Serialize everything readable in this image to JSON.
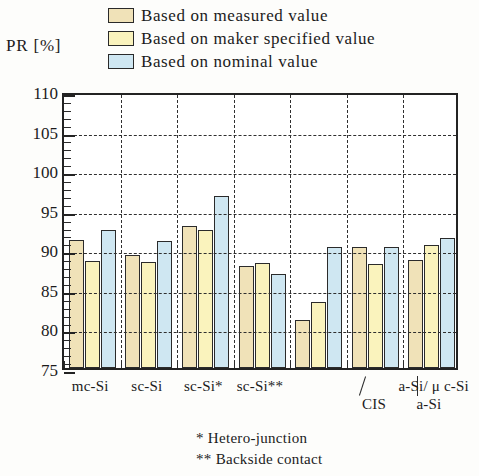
{
  "legend": {
    "items": [
      {
        "label": "Based on measured value",
        "color": "#f0e2b8"
      },
      {
        "label": "Based on maker specified value",
        "color": "#faf3bd"
      },
      {
        "label": "Based on nominal value",
        "color": "#cfe7f2"
      }
    ]
  },
  "axis": {
    "y_title": "PR [%]",
    "y_ticks": [
      "110",
      "105",
      "100",
      "95",
      "90",
      "85",
      "80",
      "75"
    ]
  },
  "footnotes": {
    "line1": "*  Hetero-junction",
    "line2": "** Backside  contact"
  },
  "x_row2": {
    "cis": "CIS",
    "asi": "a-Si"
  },
  "chart_data": {
    "type": "bar",
    "title": "",
    "xlabel": "",
    "ylabel": "PR [%]",
    "ylim": [
      75,
      110
    ],
    "ytick_step": 5,
    "grid": "horizontal-dashed + vertical-group-separators",
    "legend_position": "top",
    "categories": [
      "mc-Si",
      "sc-Si",
      "sc-Si*",
      "sc-Si**",
      "CIS",
      "a-Si",
      "a-Si/ μ c-Si"
    ],
    "series": [
      {
        "name": "Based on measured value",
        "color": "#f0e2b8",
        "values": [
          91.2,
          89.3,
          93.0,
          87.9,
          81.1,
          90.3,
          88.7
        ]
      },
      {
        "name": "Based on maker specified value",
        "color": "#faf3bd",
        "values": [
          88.5,
          88.4,
          92.4,
          88.3,
          83.3,
          88.2,
          90.5
        ]
      },
      {
        "name": "Based on nominal value",
        "color": "#cfe7f2",
        "values": [
          92.4,
          91.0,
          96.7,
          86.9,
          90.3,
          90.3,
          91.4
        ]
      }
    ]
  }
}
